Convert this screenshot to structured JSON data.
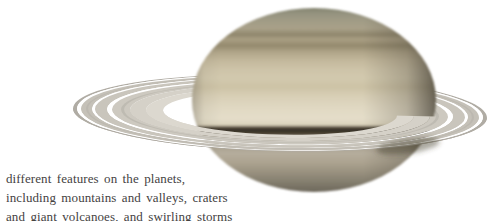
{
  "page": {
    "background": "#ffffff"
  },
  "figure": {
    "alt": "Photograph of the planet Saturn encircled by its ring system, lit from the left with the right limb in shadow",
    "colors": {
      "background": "#ffffff",
      "planet_polar_cap": "#83836f",
      "planet_tan_band": "#b0a589",
      "planet_equator_cream": "#e4ddc9",
      "planet_ring_shadow_band": "#332d24",
      "planet_lower_gray": "#a29a8a",
      "ring_outer_gray": "#b0aca4",
      "ring_mid_gray": "#c9c5bc",
      "ring_inner_cream": "#dcd8cf",
      "ring_gap": "#ffffff"
    }
  },
  "caption": {
    "text_color": "#44423f",
    "lines": [
      "different features on the planets,",
      "including mountains and valleys, craters",
      "and giant volcanoes, and swirling storms"
    ]
  }
}
